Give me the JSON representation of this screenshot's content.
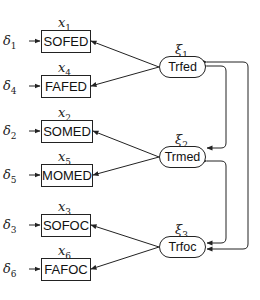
{
  "diagram": {
    "type": "structural-equation-model",
    "observed": [
      {
        "id": "x1",
        "label": "SOFED",
        "indicator_symbol": "x",
        "indicator_index": "1",
        "error_symbol": "δ",
        "error_index": "1",
        "factor": "xi1"
      },
      {
        "id": "x4",
        "label": "FAFED",
        "indicator_symbol": "x",
        "indicator_index": "4",
        "error_symbol": "δ",
        "error_index": "4",
        "factor": "xi1"
      },
      {
        "id": "x2",
        "label": "SOMED",
        "indicator_symbol": "x",
        "indicator_index": "2",
        "error_symbol": "δ",
        "error_index": "2",
        "factor": "xi2"
      },
      {
        "id": "x5",
        "label": "MOMED",
        "indicator_symbol": "x",
        "indicator_index": "5",
        "error_symbol": "δ",
        "error_index": "5",
        "factor": "xi2"
      },
      {
        "id": "x3",
        "label": "SOFOC",
        "indicator_symbol": "x",
        "indicator_index": "3",
        "error_symbol": "δ",
        "error_index": "3",
        "factor": "xi3"
      },
      {
        "id": "x6",
        "label": "FAFOC",
        "indicator_symbol": "x",
        "indicator_index": "6",
        "error_symbol": "δ",
        "error_index": "6",
        "factor": "xi3"
      }
    ],
    "latent": [
      {
        "id": "xi1",
        "label": "Trfed",
        "symbol": "ξ",
        "index": "1"
      },
      {
        "id": "xi2",
        "label": "Trmed",
        "symbol": "ξ",
        "index": "2"
      },
      {
        "id": "xi3",
        "label": "Trfoc",
        "symbol": "ξ",
        "index": "3"
      }
    ],
    "covariances": [
      {
        "from": "xi1",
        "to": "xi2"
      },
      {
        "from": "xi2",
        "to": "xi3"
      },
      {
        "from": "xi1",
        "to": "xi3"
      }
    ],
    "colors": {
      "stroke": "#222222",
      "background": "#ffffff",
      "text": "#111111"
    }
  }
}
